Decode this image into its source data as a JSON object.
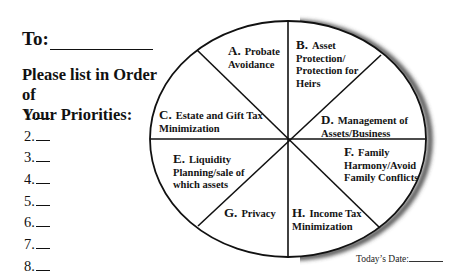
{
  "header": {
    "to_label": "To:",
    "to_value": ""
  },
  "instructions": {
    "line1": "Please list in Order of",
    "line2": "Your Priorities:"
  },
  "priority_list": [
    {
      "number": "1.",
      "value": ""
    },
    {
      "number": "2.",
      "value": ""
    },
    {
      "number": "3.",
      "value": ""
    },
    {
      "number": "4.",
      "value": ""
    },
    {
      "number": "5.",
      "value": ""
    },
    {
      "number": "6.",
      "value": ""
    },
    {
      "number": "7.",
      "value": ""
    },
    {
      "number": "8.",
      "value": ""
    }
  ],
  "wheel": {
    "segments": [
      {
        "letter": "A.",
        "lines": [
          "Probate",
          "Avoidance"
        ]
      },
      {
        "letter": "B.",
        "lines": [
          "Asset",
          "Protection/",
          "Protection for",
          "Heirs"
        ]
      },
      {
        "letter": "C.",
        "lines": [
          "Estate and Gift Tax",
          "Minimization"
        ]
      },
      {
        "letter": "D.",
        "lines": [
          "Management of",
          "Assets/Business"
        ]
      },
      {
        "letter": "E.",
        "lines": [
          "Liquidity",
          "Planning/sale of",
          "which assets"
        ]
      },
      {
        "letter": "F.",
        "lines": [
          "Family",
          "Harmony/Avoid",
          "Family Conflicts"
        ]
      },
      {
        "letter": "G.",
        "lines": [
          "Privacy"
        ]
      },
      {
        "letter": "H.",
        "lines": [
          "Income Tax",
          "Minimization"
        ]
      }
    ],
    "colors": {
      "stroke": "#111111",
      "shadow": "#555555"
    }
  },
  "footer": {
    "date_label": "Today’s Date:",
    "date_value": ""
  }
}
